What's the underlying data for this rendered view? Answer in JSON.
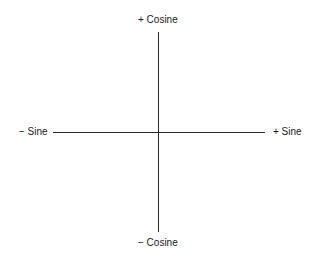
{
  "diagram": {
    "type": "axes",
    "labels": {
      "top": "+ Cosine",
      "bottom": "− Cosine",
      "left": "− Sine",
      "right": "+ Sine"
    },
    "colors": {
      "line": "#2a2a2a",
      "text": "#1a1a1a",
      "background": "#ffffff"
    }
  }
}
